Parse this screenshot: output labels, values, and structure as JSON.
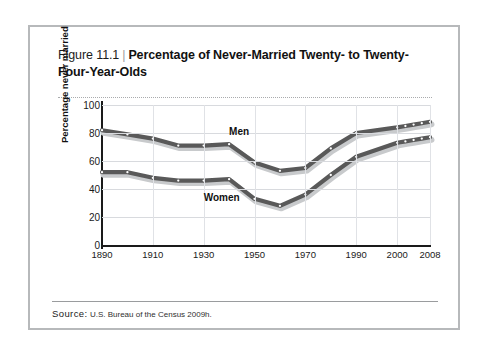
{
  "figure": {
    "number_label": "Figure 11.1",
    "separator": "|",
    "title": "Percentage of Never-Married Twenty- to Twenty-Four-Year-Olds",
    "source_word": "Source:",
    "source_text": "U.S. Bureau of the Census 2009h."
  },
  "chart_data": {
    "type": "line",
    "title": "Percentage of Never-Married Twenty- to Twenty-Four-Year-Olds",
    "xlabel": "",
    "ylabel": "Percentage never married",
    "ylim": [
      0,
      100
    ],
    "yticks": [
      0,
      20,
      40,
      60,
      80,
      100
    ],
    "xticks": [
      1890,
      1910,
      1930,
      1950,
      1970,
      1990,
      2000,
      2008
    ],
    "grid": true,
    "legend_position": "inline-labels",
    "x": [
      1890,
      1900,
      1910,
      1920,
      1930,
      1940,
      1950,
      1960,
      1970,
      1980,
      1990,
      2000,
      2002,
      2004,
      2006,
      2008
    ],
    "series": [
      {
        "name": "Men",
        "color": "#595959",
        "values": [
          82,
          79,
          76,
          71,
          71,
          72,
          59,
          53,
          55,
          69,
          80,
          84,
          85,
          86,
          87,
          88
        ]
      },
      {
        "name": "Women",
        "color": "#595959",
        "values": [
          52,
          52,
          48,
          46,
          46,
          47,
          33,
          28,
          36,
          50,
          63,
          73,
          74,
          75,
          76,
          77
        ]
      }
    ],
    "annotations": [
      {
        "text": "Men",
        "x": 1940,
        "y": 80
      },
      {
        "text": "Women",
        "x": 1930,
        "y": 33
      }
    ]
  },
  "colors": {
    "frame_border": "#b7b9bb",
    "grid": "#d8dade",
    "axis": "#1a1a1a",
    "line": "#595959",
    "line_shadow": "#c8cacc",
    "marker_fill": "#ffffff"
  }
}
